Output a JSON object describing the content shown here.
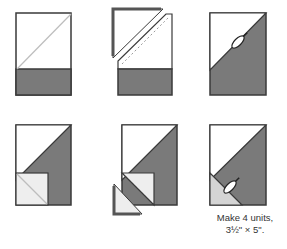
{
  "diagram": {
    "colors": {
      "background": "#ffffff",
      "outline": "#3a3a3a",
      "dark_fabric": "#7a7a7a",
      "light_fabric": "#e6e6e6",
      "white_fabric": "#ffffff",
      "guide_line": "#bdbdbd",
      "seam_dash": "#9a9a9a"
    },
    "steps": [
      {
        "id": "step-1",
        "row": 1,
        "col": 1,
        "description": "Rectangle with dark bottom strip and light square with diagonal guide line"
      },
      {
        "id": "step-2",
        "row": 1,
        "col": 2,
        "description": "Sew on dashed diagonal line, trim and flip corner triangle"
      },
      {
        "id": "step-3",
        "row": 1,
        "col": 3,
        "description": "Press open diagonal seam with iron"
      },
      {
        "id": "step-4",
        "row": 2,
        "col": 1,
        "description": "Add small light square with diagonal guide in lower-left corner"
      },
      {
        "id": "step-5",
        "row": 2,
        "col": 2,
        "description": "Sew on dashed line, trim and flip small triangle"
      },
      {
        "id": "step-6",
        "row": 2,
        "col": 3,
        "description": "Press finished unit with iron"
      }
    ],
    "caption": {
      "line1": "Make 4 units,",
      "line2": "3½\" × 5\"."
    },
    "icons": [
      "iron-icon",
      "iron-icon"
    ]
  }
}
